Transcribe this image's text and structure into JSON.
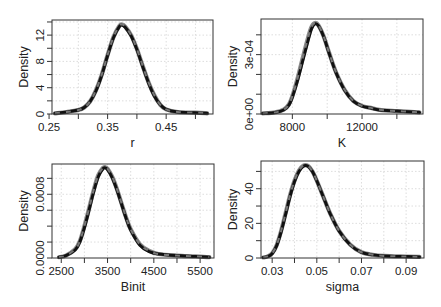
{
  "figure": {
    "layout": "2x2 grid of density plots",
    "line_color_main": "#111111",
    "line_color_overlay": "#8a8a8a",
    "grid_color": "#d4d4d4"
  },
  "chart_data": [
    {
      "type": "line",
      "title": "",
      "xlabel": "r",
      "ylabel": "Density",
      "xlim": [
        0.255,
        0.53
      ],
      "ylim": [
        0,
        14.3
      ],
      "x_ticks": [
        0.25,
        0.3,
        0.35,
        0.4,
        0.45,
        0.5
      ],
      "x_tick_labels": [
        "0.25",
        "",
        "0.35",
        "",
        "0.45",
        ""
      ],
      "y_ticks": [
        0,
        2,
        4,
        6,
        8,
        10,
        12,
        14
      ],
      "y_tick_labels": [
        "0",
        "",
        "4",
        "",
        "8",
        "",
        "12",
        ""
      ],
      "grid": true,
      "legend": null,
      "series": [
        {
          "name": "density (solid black)",
          "x": [
            0.26,
            0.28,
            0.3,
            0.31,
            0.32,
            0.33,
            0.34,
            0.35,
            0.36,
            0.37,
            0.375,
            0.38,
            0.39,
            0.4,
            0.41,
            0.42,
            0.43,
            0.44,
            0.45,
            0.47,
            0.5,
            0.52
          ],
          "values": [
            0.1,
            0.3,
            0.6,
            1.0,
            1.9,
            3.5,
            5.9,
            8.9,
            11.6,
            13.3,
            13.5,
            13.2,
            11.9,
            9.8,
            7.2,
            4.7,
            2.7,
            1.4,
            0.7,
            0.3,
            0.2,
            0.1
          ]
        },
        {
          "name": "density (dashed grey)",
          "x": [
            0.26,
            0.28,
            0.3,
            0.31,
            0.32,
            0.33,
            0.34,
            0.35,
            0.36,
            0.37,
            0.375,
            0.38,
            0.39,
            0.4,
            0.41,
            0.42,
            0.43,
            0.44,
            0.45,
            0.47,
            0.5,
            0.52
          ],
          "values": [
            0.1,
            0.3,
            0.6,
            1.0,
            1.9,
            3.6,
            6.0,
            9.0,
            11.7,
            13.4,
            13.6,
            13.3,
            12.0,
            9.9,
            7.3,
            4.8,
            2.8,
            1.4,
            0.7,
            0.3,
            0.2,
            0.1
          ]
        }
      ]
    },
    {
      "type": "line",
      "title": "",
      "xlabel": "K",
      "ylabel": "Density",
      "xlim": [
        6200,
        15500
      ],
      "ylim": [
        0,
        0.00048
      ],
      "x_ticks": [
        8000,
        10000,
        12000,
        14000
      ],
      "x_tick_labels": [
        "8000",
        "",
        "12000",
        ""
      ],
      "y_ticks": [
        0,
        0.0001,
        0.0002,
        0.0003,
        0.0004
      ],
      "y_tick_labels": [
        "0e+00",
        "",
        "",
        "3e-04",
        ""
      ],
      "grid": true,
      "legend": null,
      "series": [
        {
          "name": "density (solid black)",
          "x": [
            6300,
            7000,
            7500,
            7800,
            8000,
            8300,
            8600,
            8900,
            9100,
            9300,
            9500,
            9800,
            10100,
            10500,
            11000,
            11500,
            12000,
            12500,
            13000,
            14000,
            15000,
            15300
          ],
          "values": [
            3e-06,
            8e-06,
            2e-05,
            4.5e-05,
            8.5e-05,
            0.00017,
            0.00027,
            0.00037,
            0.00043,
            0.000455,
            0.000445,
            0.00039,
            0.00031,
            0.00021,
            0.00012,
            6.5e-05,
            4e-05,
            3e-05,
            2e-05,
            1.5e-05,
            1e-05,
            8e-06
          ]
        },
        {
          "name": "density (dashed grey)",
          "x": [
            6300,
            7000,
            7500,
            7800,
            8000,
            8300,
            8600,
            8900,
            9100,
            9300,
            9500,
            9800,
            10100,
            10500,
            11000,
            11500,
            12000,
            12500,
            13000,
            14000,
            15000,
            15300
          ],
          "values": [
            3e-06,
            8e-06,
            2.2e-05,
            4.8e-05,
            9e-05,
            0.00018,
            0.000285,
            0.000385,
            0.00044,
            0.00046,
            0.000448,
            0.000392,
            0.000312,
            0.000212,
            0.000122,
            6.6e-05,
            4.1e-05,
            3.1e-05,
            2.1e-05,
            1.5e-05,
            1e-05,
            8e-06
          ]
        }
      ]
    },
    {
      "type": "line",
      "title": "",
      "xlabel": "Binit",
      "ylabel": "Density",
      "xlim": [
        2300,
        5800
      ],
      "ylim": [
        0,
        0.00118
      ],
      "x_ticks": [
        2500,
        3000,
        3500,
        4000,
        4500,
        5000,
        5500
      ],
      "x_tick_labels": [
        "2500",
        "",
        "3500",
        "",
        "4500",
        "",
        "5500"
      ],
      "y_ticks": [
        0,
        0.0002,
        0.0004,
        0.0006,
        0.0008,
        0.001
      ],
      "y_tick_labels": [
        "0.0000",
        "",
        "",
        "",
        "0.0008",
        ""
      ],
      "grid": true,
      "legend": null,
      "series": [
        {
          "name": "density (solid black)",
          "x": [
            2450,
            2600,
            2800,
            2900,
            3000,
            3100,
            3200,
            3300,
            3400,
            3450,
            3500,
            3600,
            3700,
            3800,
            3900,
            4000,
            4200,
            4400,
            4600,
            5000,
            5400,
            5700
          ],
          "values": [
            1e-05,
            3e-05,
            0.0001,
            0.0002,
            0.00038,
            0.0006,
            0.00083,
            0.00102,
            0.00112,
            0.00113,
            0.00111,
            0.00101,
            0.00086,
            0.00068,
            0.0005,
            0.00035,
            0.00016,
            8e-05,
            5e-05,
            3e-05,
            2e-05,
            1e-05
          ]
        },
        {
          "name": "density (dashed grey)",
          "x": [
            2450,
            2600,
            2800,
            2900,
            3000,
            3100,
            3200,
            3300,
            3400,
            3450,
            3500,
            3600,
            3700,
            3800,
            3900,
            4000,
            4200,
            4400,
            4600,
            5000,
            5400,
            5700
          ],
          "values": [
            1e-05,
            3e-05,
            0.00011,
            0.00021,
            0.0004,
            0.00062,
            0.00085,
            0.00104,
            0.00113,
            0.00114,
            0.00112,
            0.00102,
            0.00087,
            0.00069,
            0.00051,
            0.00036,
            0.00017,
            9e-05,
            5e-05,
            3e-05,
            2e-05,
            1e-05
          ]
        }
      ]
    },
    {
      "type": "line",
      "title": "",
      "xlabel": "sigma",
      "ylabel": "Density",
      "xlim": [
        0.025,
        0.098
      ],
      "ylim": [
        0,
        56
      ],
      "x_ticks": [
        0.03,
        0.04,
        0.05,
        0.06,
        0.07,
        0.08,
        0.09
      ],
      "x_tick_labels": [
        "0.03",
        "",
        "0.05",
        "",
        "0.07",
        "",
        "0.09"
      ],
      "y_ticks": [
        0,
        10,
        20,
        30,
        40,
        50
      ],
      "y_tick_labels": [
        "0",
        "",
        "20",
        "",
        "40",
        ""
      ],
      "grid": true,
      "legend": null,
      "series": [
        {
          "name": "density (solid black)",
          "x": [
            0.026,
            0.028,
            0.03,
            0.032,
            0.034,
            0.036,
            0.038,
            0.04,
            0.042,
            0.044,
            0.046,
            0.048,
            0.05,
            0.053,
            0.056,
            0.06,
            0.065,
            0.07,
            0.075,
            0.08,
            0.09,
            0.096
          ],
          "values": [
            0.3,
            0.8,
            2.5,
            7.0,
            15.0,
            25.0,
            35.5,
            44.0,
            50.0,
            53.0,
            53.0,
            50.0,
            44.5,
            35.0,
            25.5,
            15.5,
            7.5,
            3.2,
            1.8,
            1.2,
            0.8,
            0.6
          ]
        },
        {
          "name": "density (dashed grey)",
          "x": [
            0.026,
            0.028,
            0.03,
            0.032,
            0.034,
            0.036,
            0.038,
            0.04,
            0.042,
            0.044,
            0.046,
            0.048,
            0.05,
            0.053,
            0.056,
            0.06,
            0.065,
            0.07,
            0.075,
            0.08,
            0.09,
            0.096
          ],
          "values": [
            0.3,
            0.9,
            2.7,
            7.4,
            15.6,
            25.8,
            36.2,
            44.6,
            50.5,
            53.4,
            53.2,
            50.1,
            44.6,
            35.1,
            25.6,
            15.6,
            7.6,
            3.3,
            1.9,
            1.2,
            0.8,
            0.6
          ]
        }
      ]
    }
  ],
  "panels": [
    {
      "box": [
        52,
        20,
        213,
        114
      ]
    },
    {
      "box": [
        261,
        19,
        423,
        114
      ]
    },
    {
      "box": [
        52,
        164,
        214,
        258
      ]
    },
    {
      "box": [
        261,
        161,
        424,
        258
      ]
    }
  ]
}
